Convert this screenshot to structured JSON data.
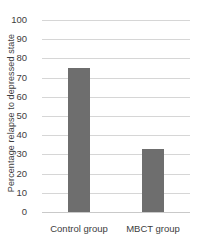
{
  "chart_data": {
    "type": "bar",
    "title": "",
    "xlabel": "",
    "ylabel": "Percentage relapse to depressed state",
    "categories": [
      "Control group",
      "MBCT group"
    ],
    "values": [
      75,
      33
    ],
    "ylim": [
      0,
      100
    ],
    "ytick_labels": [
      "0",
      "10",
      "20",
      "30",
      "40",
      "50",
      "60",
      "70",
      "80",
      "90",
      "100"
    ],
    "ytick_values": [
      0,
      10,
      20,
      30,
      40,
      50,
      60,
      70,
      80,
      90,
      100
    ],
    "grid": "horizontal",
    "legend": "none",
    "bar_color": "#6e6e6e",
    "gridline_color": "#d6d6d6",
    "background_color": "#ffffff",
    "text_color": "#3d3d3d"
  }
}
